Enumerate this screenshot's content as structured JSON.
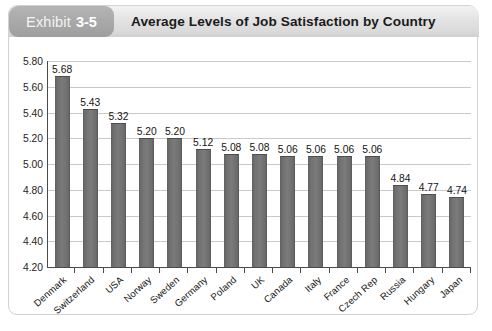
{
  "exhibit": {
    "label": "Exhibit",
    "number": "3-5",
    "title": "Average Levels of Job Satisfaction by Country"
  },
  "colors": {
    "badge_gray": "#a9a9a9",
    "header_band": "#e3e3e3",
    "bar_gray": "#7b7b7b",
    "gridline": "#c9c9c9",
    "axis": "#4a4a4a",
    "plot_background": "#ffffff",
    "card_border": "#d2d2d2"
  },
  "chart_data": {
    "type": "bar",
    "title": "Average Levels of Job Satisfaction by Country",
    "xlabel": "",
    "ylabel": "",
    "ylim": [
      4.2,
      5.8
    ],
    "ytick_step": 0.2,
    "yticks": [
      "5.80",
      "5.60",
      "5.40",
      "5.20",
      "5.00",
      "4.80",
      "4.60",
      "4.40",
      "4.20"
    ],
    "grid": true,
    "legend": "none",
    "orientation": "vertical",
    "value_labels": true,
    "categories": [
      "Denmark",
      "Switzerland",
      "USA",
      "Norway",
      "Sweden",
      "Germany",
      "Poland",
      "UK",
      "Canada",
      "Italy",
      "France",
      "Czech Rep",
      "Russia",
      "Hungary",
      "Japan"
    ],
    "values": [
      5.68,
      5.43,
      5.32,
      5.2,
      5.2,
      5.12,
      5.08,
      5.08,
      5.06,
      5.06,
      5.06,
      5.06,
      4.84,
      4.77,
      4.74
    ],
    "value_labels_text": [
      "5.68",
      "5.43",
      "5.32",
      "5.20",
      "5.20",
      "5.12",
      "5.08",
      "5.08",
      "5.06",
      "5.06",
      "5.06",
      "5.06",
      "4.84",
      "4.77",
      "4.74"
    ]
  }
}
